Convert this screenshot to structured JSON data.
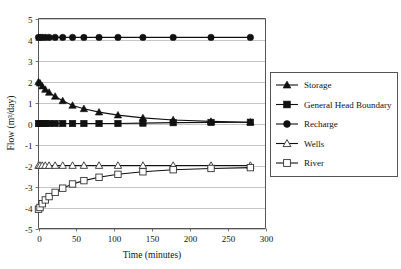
{
  "chart_data": {
    "type": "line",
    "title": "",
    "xlabel": "Time (minutes)",
    "ylabel": "Flow (m³/day)",
    "xlim": [
      0,
      300
    ],
    "ylim": [
      -5,
      5
    ],
    "xticks": [
      0,
      50,
      100,
      150,
      200,
      250,
      300
    ],
    "yticks": [
      -5,
      -4,
      -3,
      -2,
      -1,
      0,
      1,
      2,
      3,
      4,
      5
    ],
    "grid": "horizontal",
    "legend_position": "right-outside",
    "x": [
      0,
      2,
      5,
      9,
      14,
      22,
      32,
      45,
      60,
      80,
      105,
      138,
      178,
      228,
      280
    ],
    "series": [
      {
        "name": "Storage",
        "marker": "filled-triangle",
        "values": [
          1.98,
          1.92,
          1.78,
          1.62,
          1.48,
          1.29,
          1.08,
          0.86,
          0.7,
          0.54,
          0.4,
          0.27,
          0.17,
          0.1,
          0.06
        ]
      },
      {
        "name": "General Head Boundary",
        "marker": "filled-square",
        "values": [
          0.0,
          0.0,
          0.0,
          0.0,
          0.0,
          0.0,
          0.0,
          0.0,
          0.0,
          0.0,
          0.0,
          0.02,
          0.04,
          0.05,
          0.06
        ]
      },
      {
        "name": "Recharge",
        "marker": "filled-circle",
        "values": [
          4.1,
          4.1,
          4.1,
          4.1,
          4.1,
          4.1,
          4.1,
          4.1,
          4.1,
          4.1,
          4.1,
          4.1,
          4.1,
          4.1,
          4.1
        ]
      },
      {
        "name": "Wells",
        "marker": "open-triangle",
        "values": [
          -2.0,
          -2.0,
          -2.0,
          -2.0,
          -2.0,
          -2.0,
          -2.0,
          -2.0,
          -2.0,
          -2.0,
          -2.0,
          -2.0,
          -2.0,
          -2.0,
          -2.0
        ]
      },
      {
        "name": "River",
        "marker": "open-square",
        "values": [
          -4.08,
          -4.0,
          -3.82,
          -3.64,
          -3.48,
          -3.28,
          -3.08,
          -2.88,
          -2.72,
          -2.56,
          -2.42,
          -2.3,
          -2.2,
          -2.14,
          -2.1
        ]
      }
    ]
  },
  "axes": {
    "x_tick_labels": [
      "0",
      "50",
      "100",
      "150",
      "200",
      "250",
      "300"
    ],
    "y_tick_labels": [
      "5",
      "4",
      "3",
      "2",
      "1",
      "0",
      "-1",
      "-2",
      "-3",
      "-4",
      "-5"
    ],
    "x_title": "Time (minutes)",
    "y_title": "Flow (m³/day)"
  },
  "legend": {
    "items": [
      {
        "label": "Storage",
        "marker": "filled-triangle"
      },
      {
        "label": "General Head Boundary",
        "marker": "filled-square"
      },
      {
        "label": "Recharge",
        "marker": "filled-circle"
      },
      {
        "label": "Wells",
        "marker": "open-triangle"
      },
      {
        "label": "River",
        "marker": "open-square"
      }
    ]
  },
  "colors": {
    "series_stroke": "#111111",
    "grid": "#b8b8b8",
    "axis": "#555555",
    "background": "#ffffff"
  }
}
